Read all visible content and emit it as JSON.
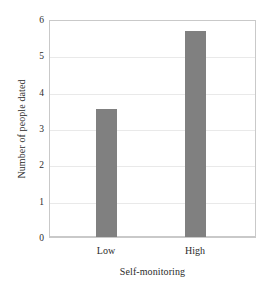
{
  "chart_data": {
    "type": "bar",
    "title": "",
    "xlabel": "Self-monitoring",
    "ylabel": "Number of people dated",
    "categories": [
      "Low",
      "High"
    ],
    "values": [
      3.55,
      5.73
    ],
    "ylim": [
      0,
      6
    ],
    "yticks": [
      0,
      1,
      2,
      3,
      4,
      5,
      6
    ],
    "ytick_labels": [
      "0",
      "1",
      "2",
      "3",
      "4",
      "5",
      "6"
    ],
    "grid": "horizontal",
    "legend": "none",
    "bar_color": "#808080",
    "gridline_color": "#e9e9e9",
    "axis_color": "#c9c9c9",
    "background_color": "#ffffff"
  },
  "axes": {
    "y_title": "Number of people dated",
    "x_title": "Self-monitoring",
    "y_tick_0": "0",
    "y_tick_1": "1",
    "y_tick_2": "2",
    "y_tick_3": "3",
    "y_tick_4": "4",
    "y_tick_5": "5",
    "y_tick_6": "6",
    "x_tick_low": "Low",
    "x_tick_high": "High"
  }
}
